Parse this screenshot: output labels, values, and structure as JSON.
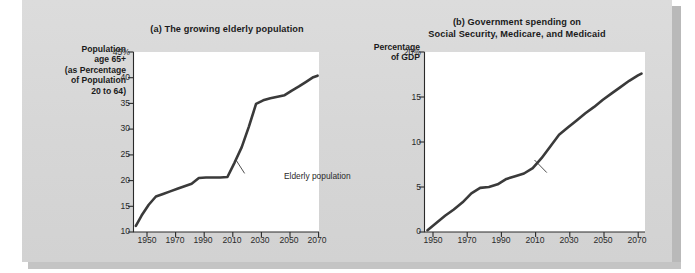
{
  "figure": {
    "background_color": "#d7d7d7",
    "plot_background_color": "#ffffff",
    "line_color": "#3a3a3a"
  },
  "charts": [
    {
      "id": "a",
      "title": "(a) The growing elderly population",
      "y_axis_title": "Population\nage 65+\n(as Percentage\nof Population\n20 to 64)",
      "y_axis_title_lines": [
        "Population",
        "age 65+",
        "(as Percentage",
        "of Population",
        "20 to 64)"
      ],
      "y_ticks": [
        "45%",
        "40",
        "35",
        "30",
        "25",
        "20",
        "15",
        "10"
      ],
      "x_ticks": [
        "1950",
        "1970",
        "1990",
        "2010",
        "2030",
        "2050",
        "2070"
      ],
      "annotation": "Elderly population"
    },
    {
      "id": "b",
      "title_lines": [
        "(b) Government spending on",
        "Social Security, Medicare, and Medicaid"
      ],
      "title": "(b) Government spending on Social Security, Medicare, and Medicaid",
      "y_axis_title_lines": [
        "Percentage",
        "of GDP"
      ],
      "y_ticks": [
        "20%",
        "15",
        "10",
        "5",
        "0"
      ],
      "x_ticks": [
        "1950",
        "1970",
        "1990",
        "2010",
        "2030",
        "2050",
        "2070"
      ],
      "annotation": "Government spending"
    }
  ],
  "chart_data": [
    {
      "type": "line",
      "id": "a",
      "title": "(a) The growing elderly population",
      "xlabel": "",
      "ylabel": "Population age 65+ (as Percentage of Population 20 to 64)",
      "xlim": [
        1944,
        2074
      ],
      "ylim": [
        10,
        45
      ],
      "xticks": [
        1950,
        1970,
        1990,
        2010,
        2030,
        2050,
        2070
      ],
      "yticks": [
        10,
        15,
        20,
        25,
        30,
        35,
        40,
        45
      ],
      "grid": false,
      "legend": "none",
      "annotations": [
        {
          "text": "Elderly population",
          "x": 2016,
          "y": 24
        }
      ],
      "series": [
        {
          "name": "Elderly population",
          "x": [
            1946,
            1950,
            1955,
            1960,
            1965,
            1970,
            1975,
            1980,
            1985,
            1990,
            1995,
            2000,
            2005,
            2010,
            2015,
            2020,
            2025,
            2030,
            2035,
            2040,
            2045,
            2050,
            2055,
            2060,
            2065,
            2070,
            2073
          ],
          "y": [
            11.2,
            13.2,
            15.3,
            16.9,
            17.4,
            17.9,
            18.4,
            18.9,
            19.4,
            20.5,
            20.6,
            20.6,
            20.6,
            20.7,
            23.5,
            26.5,
            30.5,
            34.9,
            35.6,
            36.0,
            36.3,
            36.6,
            37.5,
            38.3,
            39.2,
            40.1,
            40.4
          ]
        }
      ]
    },
    {
      "type": "line",
      "id": "b",
      "title": "(b) Government spending on Social Security, Medicare, and Medicaid",
      "xlabel": "",
      "ylabel": "Percentage of GDP",
      "xlim": [
        1948,
        2074
      ],
      "ylim": [
        0,
        20
      ],
      "xticks": [
        1950,
        1970,
        1990,
        2010,
        2030,
        2050,
        2070
      ],
      "yticks": [
        0,
        5,
        10,
        15,
        20
      ],
      "grid": false,
      "legend": "none",
      "annotations": [
        {
          "text": "Government spending",
          "x": 2014,
          "y": 7.3
        }
      ],
      "series": [
        {
          "name": "Government spending",
          "x": [
            1950,
            1955,
            1960,
            1965,
            1970,
            1975,
            1980,
            1985,
            1990,
            1995,
            2000,
            2005,
            2010,
            2015,
            2020,
            2025,
            2030,
            2035,
            2040,
            2045,
            2050,
            2055,
            2060,
            2065,
            2070,
            2072
          ],
          "y": [
            0.2,
            1.0,
            1.8,
            2.5,
            3.3,
            4.3,
            4.9,
            5.0,
            5.3,
            5.9,
            6.2,
            6.5,
            7.1,
            8.2,
            9.5,
            10.8,
            11.6,
            12.4,
            13.2,
            13.9,
            14.7,
            15.4,
            16.1,
            16.8,
            17.4,
            17.6
          ]
        }
      ]
    }
  ]
}
